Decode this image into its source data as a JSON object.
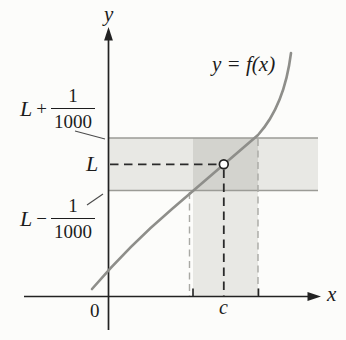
{
  "figure": {
    "curve_label": "y = f(x)",
    "axes": {
      "x_label": "x",
      "y_label": "y",
      "origin_label": "0",
      "c_tick_label": "c"
    },
    "y_labels": {
      "upper": {
        "var": "L",
        "op": "+",
        "num": "1",
        "den": "1000"
      },
      "limit": "L",
      "lower": {
        "var": "L",
        "op": "−",
        "num": "1",
        "den": "1000"
      }
    }
  },
  "colors": {
    "band": "#e8e8e4",
    "band_overlap": "#d3d3ce",
    "band_edge": "#9b9b96",
    "curve": "#8e8e8a",
    "axis": "#222222",
    "dashed_dark": "#2a2a2a",
    "dashed_gray": "#a9a9a4",
    "pointer": "#4a4a4a",
    "point_fill": "#ffffff"
  }
}
